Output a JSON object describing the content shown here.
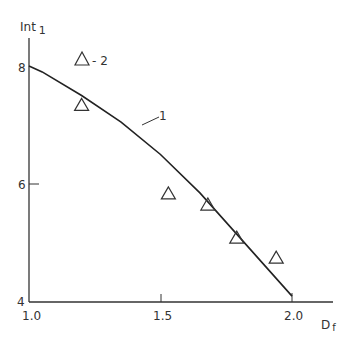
{
  "chart_data": {
    "type": "line",
    "title": "",
    "xlabel": "D_f",
    "ylabel": "Int_1",
    "xlim": [
      1.0,
      2.15
    ],
    "ylim": [
      4,
      8.5
    ],
    "x_ticks": [
      "1.0",
      "1.5",
      "2.0"
    ],
    "y_ticks": [
      "4",
      "6",
      "8"
    ],
    "grid": false,
    "series": [
      {
        "name": "1",
        "kind": "line",
        "x": [
          1.0,
          1.05,
          1.2,
          1.35,
          1.5,
          1.65,
          1.8,
          1.9,
          2.0
        ],
        "values": [
          8.0,
          7.9,
          7.5,
          7.05,
          6.5,
          5.85,
          5.1,
          4.6,
          4.1
        ]
      },
      {
        "name": "2",
        "kind": "scatter",
        "marker": "triangle",
        "x": [
          1.2,
          1.53,
          1.68,
          1.79,
          1.94
        ],
        "values": [
          7.35,
          5.85,
          5.66,
          5.1,
          4.76
        ]
      }
    ],
    "annotations": [
      {
        "text": "1",
        "target": "line"
      },
      {
        "text": "- 2",
        "target": "legend-marker"
      }
    ]
  },
  "labels": {
    "ylabel_main": "Int",
    "ylabel_sub": "1",
    "xlabel_main": "D",
    "xlabel_sub": "f",
    "xt0": "1.0",
    "xt1": "1.5",
    "xt2": "2.0",
    "yt0": "4",
    "yt1": "6",
    "yt2": "8",
    "curve_label": "1",
    "legend_label": "- 2"
  }
}
